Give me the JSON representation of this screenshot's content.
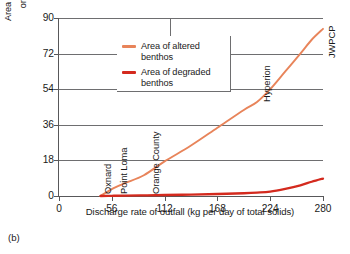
{
  "caption": "(b)",
  "legend": {
    "position": "top-left-inside",
    "entries": [
      {
        "label": "Area of altered benthos",
        "color": "#E8845A"
      },
      {
        "label": "Area of degraded benthos",
        "color": "#D42A1E"
      }
    ]
  },
  "chart_data": {
    "type": "line",
    "title": "",
    "subtitle": "",
    "xlabel": "Discharge rate of outfall (kg per day of total solids)",
    "ylabel": "Area of seafloor with degraded or altered benthos (km",
    "ylabel_sup": "2",
    "ylabel_tail": ")",
    "ylabel_line1": "Area of seafloor with degraded",
    "ylabel_line2": "or altered benthos (km",
    "xlim": [
      0,
      280
    ],
    "ylim": [
      0,
      90
    ],
    "xticks": [
      0,
      56,
      112,
      168,
      224,
      280
    ],
    "yticks": [
      0,
      18,
      36,
      54,
      72,
      90
    ],
    "xtick_labels": [
      "0",
      "56",
      "112",
      "168",
      "224",
      "280"
    ],
    "ytick_labels": [
      "0",
      "18",
      "36",
      "54",
      "72",
      "90"
    ],
    "grid": "horizontal-gridlines-plus-one-vertical",
    "vertical_gridlines": [
      118
    ],
    "series": [
      {
        "name": "Area of altered benthos",
        "color": "#E8845A",
        "x": [
          44,
          56,
          70,
          90,
          112,
          140,
          168,
          196,
          210,
          224,
          240,
          256,
          268,
          280
        ],
        "values": [
          0,
          3.5,
          6.5,
          10.5,
          17.5,
          25.5,
          34.5,
          43.5,
          47.5,
          54.0,
          63.0,
          72.0,
          79.0,
          84.5
        ]
      },
      {
        "name": "Area of degraded benthos",
        "color": "#D42A1E",
        "x": [
          44,
          56,
          70,
          90,
          112,
          140,
          168,
          196,
          210,
          224,
          240,
          256,
          268,
          280
        ],
        "values": [
          0.0,
          0.1,
          0.2,
          0.3,
          0.5,
          0.7,
          1.0,
          1.4,
          1.7,
          2.2,
          3.6,
          5.4,
          7.2,
          8.8
        ]
      }
    ],
    "annotations": [
      {
        "text": "Oxnard",
        "x": 44,
        "y": 0
      },
      {
        "text": "Point Loma",
        "x": 60,
        "y": 0
      },
      {
        "text": "Orange County",
        "x": 94,
        "y": 0
      },
      {
        "text": "Hyperion",
        "x": 212,
        "y": 46
      },
      {
        "text": "JWPCP",
        "x": 280,
        "y": 84
      }
    ]
  }
}
